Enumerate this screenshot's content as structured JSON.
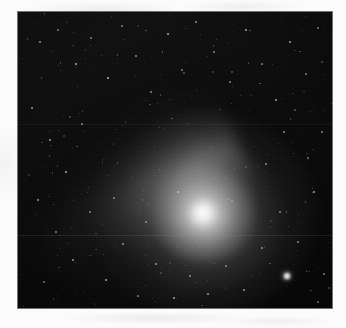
{
  "page": {
    "background_color": "#fbfbfb",
    "width": 346,
    "height": 328
  },
  "figure": {
    "name": "comet-photograph",
    "type": "astronomical-image",
    "plate": {
      "x": 18,
      "y": 12,
      "width": 314,
      "height": 296,
      "sky_color": "#0a0a0a",
      "border_color": "#000000"
    },
    "caption": "",
    "label": ""
  },
  "chart_data": {
    "type": "scatter",
    "title": "",
    "subtitle": "",
    "xlabel": "",
    "ylabel": "",
    "grid": false,
    "legend": null,
    "xlim": [
      0,
      314
    ],
    "ylim": [
      0,
      296
    ],
    "annotations": [],
    "objects": [
      {
        "name": "comet-nucleus",
        "kind": "nucleus",
        "x": 185,
        "y": 201,
        "radius": 14,
        "brightness": 1.0,
        "color": "#ffffff"
      },
      {
        "name": "comet-coma",
        "kind": "coma",
        "x": 185,
        "y": 201,
        "radius_x": 115,
        "radius_y": 102,
        "brightness": 0.55,
        "color": "#e9e9e9"
      },
      {
        "name": "comet-tail",
        "kind": "dust-tail",
        "origin_x": 185,
        "origin_y": 201,
        "direction_degrees": -27,
        "length": 210,
        "width": 78,
        "brightness": 0.5,
        "color": "#b9b9b9"
      },
      {
        "name": "bright-field-star",
        "kind": "star",
        "x": 269,
        "y": 264,
        "radius": 2.6,
        "brightness": 0.95,
        "color": "#ffffff"
      }
    ],
    "field_stars": [
      {
        "x": 22,
        "y": 30,
        "r": 0.7,
        "b": 0.55
      },
      {
        "x": 40,
        "y": 18,
        "r": 0.6,
        "b": 0.45
      },
      {
        "x": 58,
        "y": 52,
        "r": 0.8,
        "b": 0.6
      },
      {
        "x": 73,
        "y": 26,
        "r": 0.6,
        "b": 0.4
      },
      {
        "x": 90,
        "y": 66,
        "r": 0.9,
        "b": 0.7
      },
      {
        "x": 104,
        "y": 14,
        "r": 0.6,
        "b": 0.42
      },
      {
        "x": 118,
        "y": 44,
        "r": 0.7,
        "b": 0.5
      },
      {
        "x": 133,
        "y": 80,
        "r": 0.7,
        "b": 0.48
      },
      {
        "x": 150,
        "y": 22,
        "r": 0.8,
        "b": 0.58
      },
      {
        "x": 164,
        "y": 58,
        "r": 0.6,
        "b": 0.38
      },
      {
        "x": 178,
        "y": 10,
        "r": 0.7,
        "b": 0.5
      },
      {
        "x": 196,
        "y": 40,
        "r": 0.6,
        "b": 0.42
      },
      {
        "x": 212,
        "y": 70,
        "r": 0.7,
        "b": 0.46
      },
      {
        "x": 228,
        "y": 18,
        "r": 0.8,
        "b": 0.6
      },
      {
        "x": 244,
        "y": 52,
        "r": 0.6,
        "b": 0.4
      },
      {
        "x": 258,
        "y": 88,
        "r": 0.7,
        "b": 0.52
      },
      {
        "x": 272,
        "y": 30,
        "r": 0.9,
        "b": 0.66
      },
      {
        "x": 288,
        "y": 62,
        "r": 0.6,
        "b": 0.44
      },
      {
        "x": 300,
        "y": 16,
        "r": 0.7,
        "b": 0.48
      },
      {
        "x": 14,
        "y": 96,
        "r": 0.8,
        "b": 0.56
      },
      {
        "x": 32,
        "y": 128,
        "r": 0.7,
        "b": 0.5
      },
      {
        "x": 48,
        "y": 160,
        "r": 0.9,
        "b": 0.64
      },
      {
        "x": 64,
        "y": 112,
        "r": 0.6,
        "b": 0.4
      },
      {
        "x": 20,
        "y": 188,
        "r": 0.8,
        "b": 0.54
      },
      {
        "x": 38,
        "y": 220,
        "r": 0.7,
        "b": 0.46
      },
      {
        "x": 55,
        "y": 248,
        "r": 0.7,
        "b": 0.5
      },
      {
        "x": 72,
        "y": 200,
        "r": 0.6,
        "b": 0.38
      },
      {
        "x": 88,
        "y": 268,
        "r": 0.8,
        "b": 0.58
      },
      {
        "x": 105,
        "y": 232,
        "r": 0.7,
        "b": 0.46
      },
      {
        "x": 120,
        "y": 284,
        "r": 0.6,
        "b": 0.42
      },
      {
        "x": 138,
        "y": 252,
        "r": 0.7,
        "b": 0.48
      },
      {
        "x": 156,
        "y": 286,
        "r": 0.8,
        "b": 0.56
      },
      {
        "x": 172,
        "y": 264,
        "r": 0.6,
        "b": 0.4
      },
      {
        "x": 190,
        "y": 282,
        "r": 0.7,
        "b": 0.5
      },
      {
        "x": 208,
        "y": 254,
        "r": 0.6,
        "b": 0.38
      },
      {
        "x": 226,
        "y": 278,
        "r": 0.8,
        "b": 0.54
      },
      {
        "x": 244,
        "y": 236,
        "r": 0.7,
        "b": 0.46
      },
      {
        "x": 262,
        "y": 200,
        "r": 0.6,
        "b": 0.4
      },
      {
        "x": 280,
        "y": 230,
        "r": 0.7,
        "b": 0.48
      },
      {
        "x": 296,
        "y": 180,
        "r": 0.8,
        "b": 0.56
      },
      {
        "x": 304,
        "y": 120,
        "r": 0.7,
        "b": 0.44
      },
      {
        "x": 290,
        "y": 146,
        "r": 0.6,
        "b": 0.38
      },
      {
        "x": 266,
        "y": 120,
        "r": 0.7,
        "b": 0.46
      },
      {
        "x": 248,
        "y": 152,
        "r": 0.6,
        "b": 0.4
      },
      {
        "x": 306,
        "y": 262,
        "r": 0.7,
        "b": 0.5
      },
      {
        "x": 300,
        "y": 290,
        "r": 0.6,
        "b": 0.42
      },
      {
        "x": 160,
        "y": 180,
        "r": 0.6,
        "b": 0.36
      },
      {
        "x": 96,
        "y": 186,
        "r": 0.6,
        "b": 0.38
      },
      {
        "x": 128,
        "y": 210,
        "r": 0.6,
        "b": 0.36
      },
      {
        "x": 26,
        "y": 270,
        "r": 0.7,
        "b": 0.44
      }
    ],
    "artifacts": [
      {
        "name": "scan-line",
        "kind": "horizontal-line",
        "y": 223,
        "opacity": 0.14
      },
      {
        "name": "scan-line",
        "kind": "horizontal-line",
        "y": 112,
        "opacity": 0.07
      }
    ]
  }
}
